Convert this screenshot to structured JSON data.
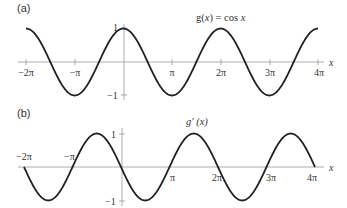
{
  "chart_data": [
    {
      "type": "line",
      "panel_label": "(a)",
      "title": "g(x) = cos x",
      "title_parts": {
        "pre": "g(",
        "var": "x",
        "mid": ") = cos ",
        "var2": "x"
      },
      "xlabel": "x",
      "ylabel": "",
      "xlim": [
        -6.2832,
        12.5664
      ],
      "ylim": [
        -1,
        1
      ],
      "x_ticks": [
        "−2π",
        "−π",
        "π",
        "2π",
        "3π",
        "4π"
      ],
      "x_tick_values": [
        -6.2832,
        -3.1416,
        3.1416,
        6.2832,
        9.4248,
        12.5664
      ],
      "y_ticks": [
        "1",
        "−1"
      ],
      "y_tick_values": [
        1,
        -1
      ],
      "grid": false,
      "series": [
        {
          "name": "cos x",
          "function": "cos(x)",
          "x": [
            -6.2832,
            -4.7124,
            -3.1416,
            -1.5708,
            0,
            1.5708,
            3.1416,
            4.7124,
            6.2832,
            7.854,
            9.4248,
            10.9956,
            12.5664
          ],
          "values": [
            1,
            0,
            -1,
            0,
            1,
            0,
            -1,
            0,
            1,
            0,
            -1,
            0,
            1
          ]
        }
      ]
    },
    {
      "type": "line",
      "panel_label": "(b)",
      "title": "g′ (x)",
      "title_parts": {
        "pre": "g′ (",
        "var": "x",
        "post": ")"
      },
      "xlabel": "x",
      "ylabel": "",
      "xlim": [
        -6.2832,
        12.5664
      ],
      "ylim": [
        -1,
        1
      ],
      "x_ticks": [
        "−2π",
        "−π",
        "π",
        "2π",
        "3π",
        "4π"
      ],
      "x_tick_values": [
        -6.2832,
        -3.1416,
        3.1416,
        6.2832,
        9.4248,
        12.5664
      ],
      "y_ticks": [
        "1",
        "−1"
      ],
      "y_tick_values": [
        1,
        -1
      ],
      "grid": false,
      "series": [
        {
          "name": "g′(x) = −sin x",
          "function": "-sin(x)",
          "x": [
            -6.2832,
            -4.7124,
            -3.1416,
            -1.5708,
            0,
            1.5708,
            3.1416,
            4.7124,
            6.2832,
            7.854,
            9.4248,
            10.9956,
            12.5664
          ],
          "values": [
            0,
            -1,
            0,
            1,
            0,
            -1,
            0,
            1,
            0,
            -1,
            0,
            1,
            0
          ]
        }
      ]
    }
  ]
}
